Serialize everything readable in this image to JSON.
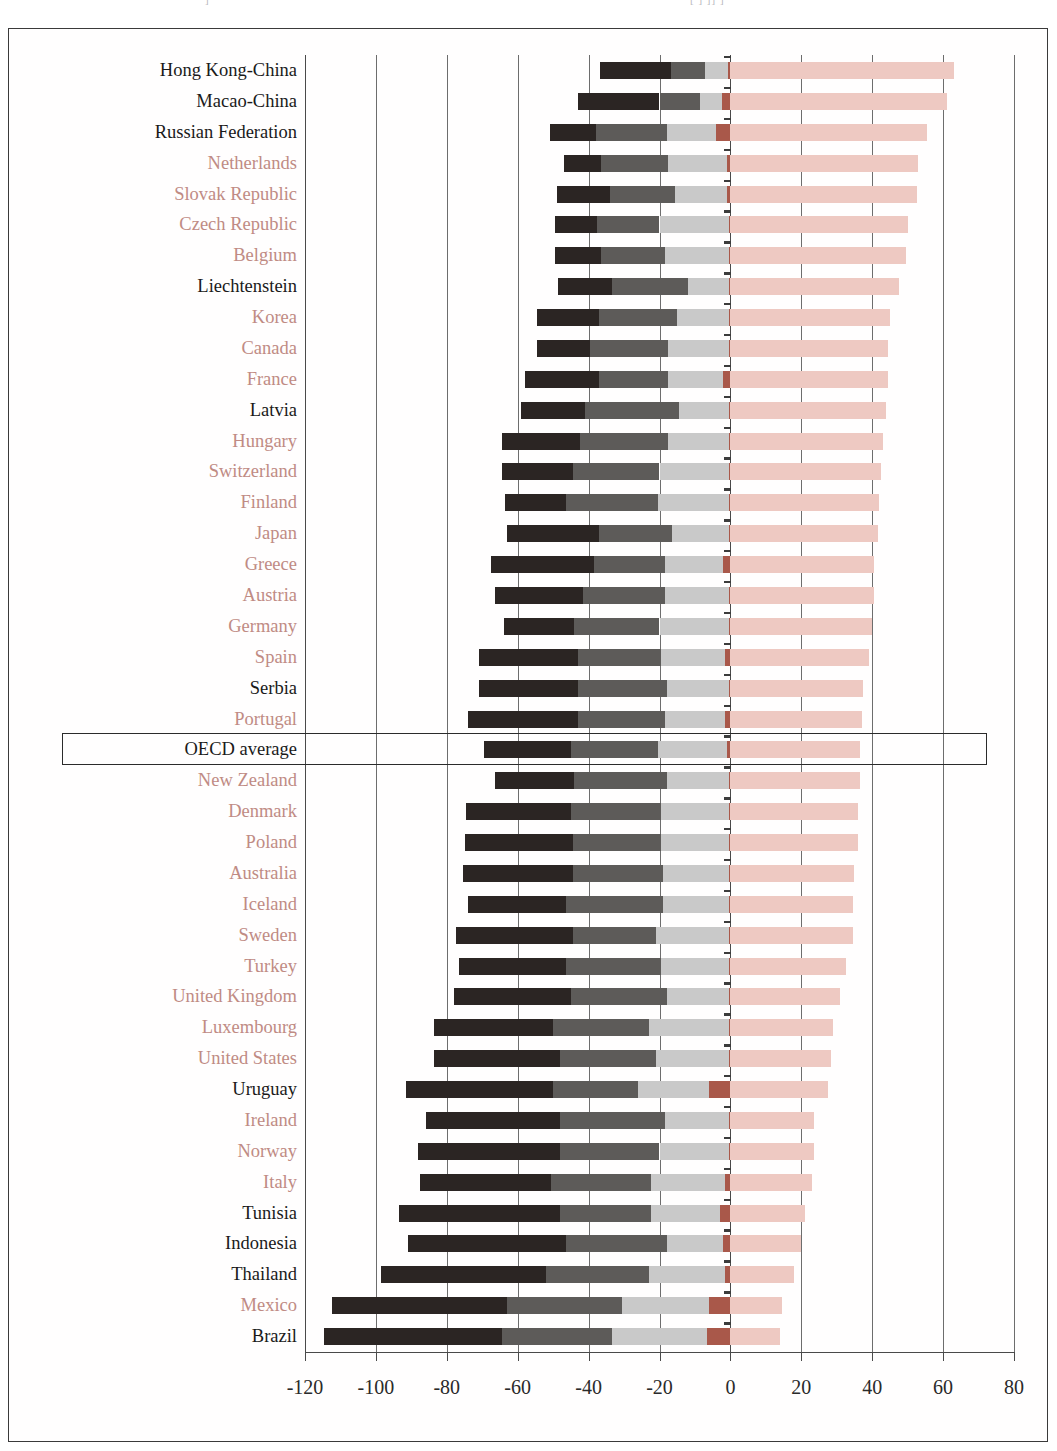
{
  "figure": {
    "top_fragment_left": "]",
    "top_fragment_right": "[      ]      ]]  ]"
  },
  "axis": {
    "tick_labels": [
      "-120",
      "-100",
      "-80",
      "-60",
      "-40",
      "-20",
      "0",
      "20",
      "40",
      "60",
      "80"
    ],
    "tick_values": [
      -120,
      -100,
      -80,
      -60,
      -40,
      -20,
      0,
      20,
      40,
      60,
      80
    ],
    "min": -120,
    "max": 80
  },
  "legend_colors": {
    "below_level_1": "#2b2523",
    "level_1": "#5d5b59",
    "level_2": "#c9c9c9",
    "level_3": "#a9584a",
    "level_4_and_above": "#eec9c2",
    "oecd_member_label": "#c08b84",
    "partner_label": "#1a1a1a"
  },
  "highlight": {
    "row": "OECD average"
  },
  "chart_data": {
    "type": "bar",
    "orientation": "horizontal",
    "stacked": true,
    "title": "",
    "xlabel": "",
    "ylabel": "",
    "xlim": [
      -120,
      80
    ],
    "grid": true,
    "legend_position": "none",
    "series": [
      {
        "name": "below level 1",
        "color": "#2b2523"
      },
      {
        "name": "level 1",
        "color": "#5d5b59"
      },
      {
        "name": "level 2",
        "color": "#c9c9c9"
      },
      {
        "name": "level 3",
        "color": "#a9584a"
      },
      {
        "name": "level 4 and above",
        "color": "#eec9c2"
      }
    ],
    "categories": [
      "Hong Kong-China",
      "Macao-China",
      "Russian Federation",
      "Netherlands",
      "Slovak Republic",
      "Czech Republic",
      "Belgium",
      "Liechtenstein",
      "Korea",
      "Canada",
      "France",
      "Latvia",
      "Hungary",
      "Switzerland",
      "Finland",
      "Japan",
      "Greece",
      "Austria",
      "Germany",
      "Spain",
      "Serbia",
      "Portugal",
      "OECD average",
      "New Zealand",
      "Denmark",
      "Poland",
      "Australia",
      "Iceland",
      "Sweden",
      "Turkey",
      "United Kingdom",
      "Luxembourg",
      "United States",
      "Uruguay",
      "Ireland",
      "Norway",
      "Italy",
      "Tunisia",
      "Indonesia",
      "Thailand",
      "Mexico",
      "Brazil"
    ],
    "rows": [
      {
        "label": "Hong Kong-China",
        "group": "partner",
        "neg_below1": -20.0,
        "neg_l1": -9.5,
        "neg_l2": -6.5,
        "neg_l3": -0.8,
        "pos_l4": 63.0
      },
      {
        "label": "Macao-China",
        "group": "partner",
        "neg_below1": -23.0,
        "neg_l1": -11.5,
        "neg_l2": -6.0,
        "neg_l3": -2.5,
        "pos_l4": 61.0
      },
      {
        "label": "Russian Federation",
        "group": "partner",
        "neg_below1": -13.0,
        "neg_l1": -20.0,
        "neg_l2": -14.0,
        "neg_l3": -4.0,
        "pos_l4": 55.5
      },
      {
        "label": "Netherlands",
        "group": "oecd",
        "neg_below1": -10.5,
        "neg_l1": -19.0,
        "neg_l2": -16.5,
        "neg_l3": -1.0,
        "pos_l4": 53.0
      },
      {
        "label": "Slovak Republic",
        "group": "oecd",
        "neg_below1": -15.0,
        "neg_l1": -18.5,
        "neg_l2": -14.5,
        "neg_l3": -1.0,
        "pos_l4": 52.5
      },
      {
        "label": "Czech Republic",
        "group": "oecd",
        "neg_below1": -12.0,
        "neg_l1": -17.5,
        "neg_l2": -19.5,
        "neg_l3": -0.5,
        "pos_l4": 50.0
      },
      {
        "label": "Belgium",
        "group": "oecd",
        "neg_below1": -13.0,
        "neg_l1": -18.0,
        "neg_l2": -18.0,
        "neg_l3": -0.5,
        "pos_l4": 49.5
      },
      {
        "label": "Liechtenstein",
        "group": "partner",
        "neg_below1": -15.0,
        "neg_l1": -21.5,
        "neg_l2": -11.5,
        "neg_l3": -0.5,
        "pos_l4": 47.5
      },
      {
        "label": "Korea",
        "group": "oecd",
        "neg_below1": -17.5,
        "neg_l1": -22.0,
        "neg_l2": -14.5,
        "neg_l3": -0.5,
        "pos_l4": 45.0
      },
      {
        "label": "Canada",
        "group": "oecd",
        "neg_below1": -15.0,
        "neg_l1": -22.0,
        "neg_l2": -17.0,
        "neg_l3": -0.5,
        "pos_l4": 44.5
      },
      {
        "label": "France",
        "group": "oecd",
        "neg_below1": -21.0,
        "neg_l1": -19.5,
        "neg_l2": -15.5,
        "neg_l3": -2.0,
        "pos_l4": 44.5
      },
      {
        "label": "Latvia",
        "group": "partner",
        "neg_below1": -18.0,
        "neg_l1": -26.5,
        "neg_l2": -14.0,
        "neg_l3": -0.5,
        "pos_l4": 44.0
      },
      {
        "label": "Hungary",
        "group": "oecd",
        "neg_below1": -22.0,
        "neg_l1": -25.0,
        "neg_l2": -17.0,
        "neg_l3": -0.5,
        "pos_l4": 43.0
      },
      {
        "label": "Switzerland",
        "group": "oecd",
        "neg_below1": -20.0,
        "neg_l1": -24.5,
        "neg_l2": -19.5,
        "neg_l3": -0.5,
        "pos_l4": 42.5
      },
      {
        "label": "Finland",
        "group": "oecd",
        "neg_below1": -17.0,
        "neg_l1": -26.0,
        "neg_l2": -20.0,
        "neg_l3": -0.5,
        "pos_l4": 42.0
      },
      {
        "label": "Japan",
        "group": "oecd",
        "neg_below1": -26.0,
        "neg_l1": -20.5,
        "neg_l2": -16.0,
        "neg_l3": -0.5,
        "pos_l4": 41.5
      },
      {
        "label": "Greece",
        "group": "oecd",
        "neg_below1": -29.0,
        "neg_l1": -20.0,
        "neg_l2": -16.5,
        "neg_l3": -2.0,
        "pos_l4": 40.5
      },
      {
        "label": "Austria",
        "group": "oecd",
        "neg_below1": -25.0,
        "neg_l1": -23.0,
        "neg_l2": -18.0,
        "neg_l3": -0.5,
        "pos_l4": 40.5
      },
      {
        "label": "Germany",
        "group": "oecd",
        "neg_below1": -20.0,
        "neg_l1": -24.0,
        "neg_l2": -19.5,
        "neg_l3": -0.5,
        "pos_l4": 40.0
      },
      {
        "label": "Spain",
        "group": "oecd",
        "neg_below1": -28.0,
        "neg_l1": -23.5,
        "neg_l2": -18.0,
        "neg_l3": -1.5,
        "pos_l4": 39.0
      },
      {
        "label": "Serbia",
        "group": "partner",
        "neg_below1": -28.0,
        "neg_l1": -25.0,
        "neg_l2": -17.5,
        "neg_l3": -0.5,
        "pos_l4": 37.5
      },
      {
        "label": "Portugal",
        "group": "oecd",
        "neg_below1": -31.0,
        "neg_l1": -24.5,
        "neg_l2": -17.0,
        "neg_l3": -1.5,
        "pos_l4": 37.0
      },
      {
        "label": "OECD average",
        "group": "average",
        "neg_below1": -24.5,
        "neg_l1": -24.5,
        "neg_l2": -19.5,
        "neg_l3": -1.0,
        "pos_l4": 36.5
      },
      {
        "label": "New Zealand",
        "group": "oecd",
        "neg_below1": -22.5,
        "neg_l1": -26.0,
        "neg_l2": -17.5,
        "neg_l3": -0.5,
        "pos_l4": 36.5
      },
      {
        "label": "Denmark",
        "group": "oecd",
        "neg_below1": -29.5,
        "neg_l1": -25.5,
        "neg_l2": -19.0,
        "neg_l3": -0.5,
        "pos_l4": 36.0
      },
      {
        "label": "Poland",
        "group": "oecd",
        "neg_below1": -30.5,
        "neg_l1": -25.0,
        "neg_l2": -19.0,
        "neg_l3": -0.5,
        "pos_l4": 36.0
      },
      {
        "label": "Australia",
        "group": "oecd",
        "neg_below1": -31.0,
        "neg_l1": -25.5,
        "neg_l2": -18.5,
        "neg_l3": -0.5,
        "pos_l4": 35.0
      },
      {
        "label": "Iceland",
        "group": "oecd",
        "neg_below1": -27.5,
        "neg_l1": -27.5,
        "neg_l2": -18.5,
        "neg_l3": -0.5,
        "pos_l4": 34.5
      },
      {
        "label": "Sweden",
        "group": "oecd",
        "neg_below1": -33.0,
        "neg_l1": -23.5,
        "neg_l2": -20.5,
        "neg_l3": -0.5,
        "pos_l4": 34.5
      },
      {
        "label": "Turkey",
        "group": "oecd",
        "neg_below1": -30.0,
        "neg_l1": -27.0,
        "neg_l2": -19.0,
        "neg_l3": -0.5,
        "pos_l4": 32.5
      },
      {
        "label": "United Kingdom",
        "group": "oecd",
        "neg_below1": -33.0,
        "neg_l1": -27.0,
        "neg_l2": -17.5,
        "neg_l3": -0.5,
        "pos_l4": 31.0
      },
      {
        "label": "Luxembourg",
        "group": "oecd",
        "neg_below1": -33.5,
        "neg_l1": -27.0,
        "neg_l2": -22.5,
        "neg_l3": -0.5,
        "pos_l4": 29.0
      },
      {
        "label": "United States",
        "group": "oecd",
        "neg_below1": -35.5,
        "neg_l1": -27.0,
        "neg_l2": -20.5,
        "neg_l3": -0.5,
        "pos_l4": 28.5
      },
      {
        "label": "Uruguay",
        "group": "partner",
        "neg_below1": -41.5,
        "neg_l1": -24.0,
        "neg_l2": -20.0,
        "neg_l3": -6.0,
        "pos_l4": 27.5
      },
      {
        "label": "Ireland",
        "group": "oecd",
        "neg_below1": -38.0,
        "neg_l1": -29.5,
        "neg_l2": -18.0,
        "neg_l3": -0.5,
        "pos_l4": 23.5
      },
      {
        "label": "Norway",
        "group": "oecd",
        "neg_below1": -40.0,
        "neg_l1": -28.0,
        "neg_l2": -19.5,
        "neg_l3": -0.5,
        "pos_l4": 23.5
      },
      {
        "label": "Italy",
        "group": "oecd",
        "neg_below1": -37.0,
        "neg_l1": -28.0,
        "neg_l2": -21.0,
        "neg_l3": -1.5,
        "pos_l4": 23.0
      },
      {
        "label": "Tunisia",
        "group": "partner",
        "neg_below1": -45.5,
        "neg_l1": -25.5,
        "neg_l2": -19.5,
        "neg_l3": -3.0,
        "pos_l4": 21.0
      },
      {
        "label": "Indonesia",
        "group": "partner",
        "neg_below1": -44.5,
        "neg_l1": -28.5,
        "neg_l2": -16.0,
        "neg_l3": -2.0,
        "pos_l4": 20.0
      },
      {
        "label": "Thailand",
        "group": "partner",
        "neg_below1": -46.5,
        "neg_l1": -29.0,
        "neg_l2": -21.5,
        "neg_l3": -1.5,
        "pos_l4": 18.0
      },
      {
        "label": "Mexico",
        "group": "oecd",
        "neg_below1": -49.5,
        "neg_l1": -32.5,
        "neg_l2": -24.5,
        "neg_l3": -6.0,
        "pos_l4": 14.5
      },
      {
        "label": "Brazil",
        "group": "partner",
        "neg_below1": -50.0,
        "neg_l1": -31.0,
        "neg_l2": -27.0,
        "neg_l3": -6.5,
        "pos_l4": 14.0
      }
    ]
  }
}
